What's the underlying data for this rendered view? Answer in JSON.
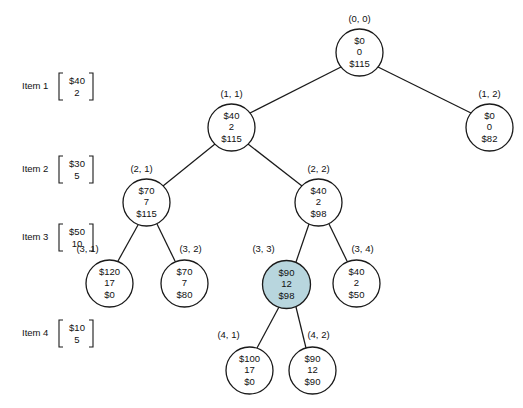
{
  "diagram": {
    "background_color": "#ffffff",
    "line_color": "#1a1a1a",
    "highlight_fill": "#b8d6de",
    "default_fill": "#ffffff"
  },
  "items": [
    {
      "name": "Item 1",
      "value": "$40",
      "weight": "2",
      "x": 22,
      "y": 85
    },
    {
      "name": "Item 2",
      "value": "$30",
      "weight": "5",
      "x": 22,
      "y": 168
    },
    {
      "name": "Item 3",
      "value": "$50",
      "weight": "10",
      "x": 22,
      "y": 236
    },
    {
      "name": "Item 4",
      "value": "$10",
      "weight": "5",
      "x": 22,
      "y": 332
    }
  ],
  "nodes": [
    {
      "id": "n00",
      "label": "(0, 0)",
      "lines": [
        "$0",
        "0",
        "$115"
      ],
      "cx": 359.5,
      "cy": 52.5,
      "r": 23.5,
      "highlighted": false,
      "label_x": 359.5,
      "label_y": 22
    },
    {
      "id": "n11",
      "label": "(1, 1)",
      "lines": [
        "$40",
        "2",
        "$115"
      ],
      "cx": 231.5,
      "cy": 127.5,
      "r": 23.5,
      "highlighted": false,
      "label_x": 231.5,
      "label_y": 97
    },
    {
      "id": "n12",
      "label": "(1, 2)",
      "lines": [
        "$0",
        "0",
        "$82"
      ],
      "cx": 489.5,
      "cy": 127.5,
      "r": 23.5,
      "highlighted": false,
      "label_x": 489.5,
      "label_y": 97
    },
    {
      "id": "n21",
      "label": "(2, 1)",
      "lines": [
        "$70",
        "7",
        "$115"
      ],
      "cx": 146.5,
      "cy": 202.5,
      "r": 23.5,
      "highlighted": false,
      "label_x": 141.5,
      "label_y": 172
    },
    {
      "id": "n22",
      "label": "(2, 2)",
      "lines": [
        "$40",
        "2",
        "$98"
      ],
      "cx": 318.5,
      "cy": 202.5,
      "r": 23.5,
      "highlighted": false,
      "label_x": 318.5,
      "label_y": 172
    },
    {
      "id": "n31",
      "label": "(3, 1)",
      "lines": [
        "$120",
        "17",
        "$0"
      ],
      "cx": 109.5,
      "cy": 283.5,
      "r": 23.5,
      "highlighted": false,
      "label_x": 87.5,
      "label_y": 252
    },
    {
      "id": "n32",
      "label": "(3, 2)",
      "lines": [
        "$70",
        "7",
        "$80"
      ],
      "cx": 184.5,
      "cy": 283.5,
      "r": 23.5,
      "highlighted": false,
      "label_x": 190.5,
      "label_y": 252
    },
    {
      "id": "n33",
      "label": "(3, 3)",
      "lines": [
        "$90",
        "12",
        "$98"
      ],
      "cx": 286.5,
      "cy": 284.5,
      "r": 24.0,
      "highlighted": true,
      "label_x": 263.5,
      "label_y": 252
    },
    {
      "id": "n34",
      "label": "(3, 4)",
      "lines": [
        "$40",
        "2",
        "$50"
      ],
      "cx": 356.5,
      "cy": 283.5,
      "r": 23.5,
      "highlighted": false,
      "label_x": 362.5,
      "label_y": 252
    },
    {
      "id": "n41",
      "label": "(4, 1)",
      "lines": [
        "$100",
        "17",
        "$0"
      ],
      "cx": 249.5,
      "cy": 370.5,
      "r": 23.5,
      "highlighted": false,
      "label_x": 228.5,
      "label_y": 338
    },
    {
      "id": "n42",
      "label": "(4, 2)",
      "lines": [
        "$90",
        "12",
        "$90"
      ],
      "cx": 312.5,
      "cy": 370.5,
      "r": 23.5,
      "highlighted": false,
      "label_x": 318.5,
      "label_y": 338
    }
  ],
  "edges": [
    {
      "from": "n00",
      "to": "n11",
      "x1": 341,
      "y1": 67,
      "x2": 250,
      "y2": 113
    },
    {
      "from": "n00",
      "to": "n12",
      "x1": 378,
      "y1": 67,
      "x2": 471,
      "y2": 113
    },
    {
      "from": "n11",
      "to": "n21",
      "x1": 215,
      "y1": 144,
      "x2": 163,
      "y2": 186
    },
    {
      "from": "n11",
      "to": "n22",
      "x1": 248,
      "y1": 144,
      "x2": 302,
      "y2": 186
    },
    {
      "from": "n21",
      "to": "n31",
      "x1": 138,
      "y1": 225,
      "x2": 118,
      "y2": 261
    },
    {
      "from": "n21",
      "to": "n32",
      "x1": 157,
      "y1": 224,
      "x2": 175,
      "y2": 261
    },
    {
      "from": "n22",
      "to": "n33",
      "x1": 309,
      "y1": 224,
      "x2": 296,
      "y2": 262
    },
    {
      "from": "n22",
      "to": "n34",
      "x1": 329,
      "y1": 224,
      "x2": 347,
      "y2": 261
    },
    {
      "from": "n33",
      "to": "n41",
      "x1": 279,
      "y1": 307,
      "x2": 257,
      "y2": 348
    },
    {
      "from": "n33",
      "to": "n42",
      "x1": 296,
      "y1": 307,
      "x2": 306,
      "y2": 348
    }
  ]
}
